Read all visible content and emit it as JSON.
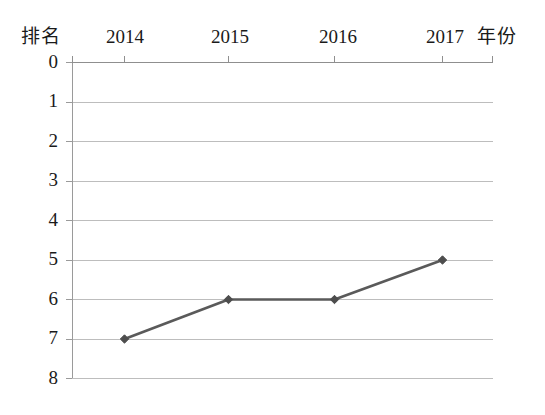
{
  "chart_data": {
    "type": "line",
    "title": "",
    "subtitle": "",
    "xlabel": "年份",
    "ylabel": "排名",
    "categories": [
      "2014",
      "2015",
      "2016",
      "2017"
    ],
    "x": [
      2014,
      2015,
      2016,
      2017
    ],
    "series": [
      {
        "name": "排名",
        "values": [
          7,
          6,
          6,
          5
        ]
      }
    ],
    "values": [
      7,
      6,
      6,
      5
    ],
    "xlim": [
      2013.5,
      2017.5
    ],
    "ylim": [
      0,
      8
    ],
    "y_inverted": true,
    "y_ticks": [
      "0",
      "1",
      "2",
      "3",
      "4",
      "5",
      "6",
      "7",
      "8"
    ],
    "x_ticks": [
      "2014",
      "2015",
      "2016",
      "2017"
    ],
    "grid": "horizontal",
    "legend": "none",
    "annotations": [],
    "colors": {
      "line": "#5a5a5a",
      "marker": "#4d4d4d",
      "grid": "#b9b9b9",
      "axis": "#8a8a8a",
      "text": "#1a1a1a",
      "background": "#ffffff"
    }
  },
  "axes": {
    "rank_label": "排名",
    "year_label": "年份"
  },
  "y_axis": {
    "ticks": [
      {
        "label": "0",
        "value": 0
      },
      {
        "label": "1",
        "value": 1
      },
      {
        "label": "2",
        "value": 2
      },
      {
        "label": "3",
        "value": 3
      },
      {
        "label": "4",
        "value": 4
      },
      {
        "label": "5",
        "value": 5
      },
      {
        "label": "6",
        "value": 6
      },
      {
        "label": "7",
        "value": 7
      },
      {
        "label": "8",
        "value": 8
      }
    ]
  },
  "x_axis": {
    "ticks": [
      {
        "label": "2014"
      },
      {
        "label": "2015"
      },
      {
        "label": "2016"
      },
      {
        "label": "2017"
      }
    ]
  }
}
